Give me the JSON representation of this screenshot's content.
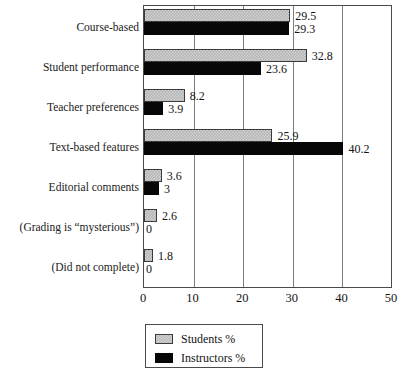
{
  "chart_data": {
    "type": "bar",
    "orientation": "horizontal",
    "title": "",
    "xlabel": "",
    "ylabel": "",
    "xlim": [
      0,
      50
    ],
    "xticks": [
      0,
      10,
      20,
      30,
      40,
      50
    ],
    "grid": true,
    "legend_position": "bottom",
    "categories": [
      "Course-based",
      "Student performance",
      "Teacher preferences",
      "Text-based features",
      "Editorial comments",
      "(Grading is “mysterious”)",
      "(Did not complete)"
    ],
    "series": [
      {
        "name": "Students %",
        "color": "#b8b8b8",
        "values": [
          29.5,
          32.8,
          8.2,
          25.9,
          3.6,
          2.6,
          1.8
        ],
        "labels": [
          "29.5",
          "32.8",
          "8.2",
          "25.9",
          "3.6",
          "2.6",
          "1.8"
        ]
      },
      {
        "name": "Instructors %",
        "color": "#070707",
        "values": [
          29.3,
          23.6,
          3.9,
          40.2,
          3,
          0,
          0
        ],
        "labels": [
          "29.3",
          "23.6",
          "3.9",
          "40.2",
          "3",
          "0",
          "0"
        ]
      }
    ]
  },
  "legend": {
    "entries": [
      {
        "label": "Students %",
        "swatch": "students"
      },
      {
        "label": "Instructors %",
        "swatch": "instructors"
      }
    ]
  }
}
